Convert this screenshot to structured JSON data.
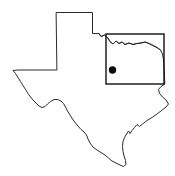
{
  "figure": {
    "name": "texas-state-map",
    "background_color": "#ffffff",
    "width": 175,
    "height": 176
  },
  "map": {
    "region_name": "Texas",
    "outline_color": "#2b2b2b",
    "outline_width": 1,
    "fill_color": "#ffffff",
    "outline_path": "M 56.5 12.5 L 92.5 12.5 L 92.5 33.5 L 99.0 33.5 L 101.0 36.5 L 104.5 35.0 L 107.5 37.5 L 110.0 41.5 L 113.0 44.0 L 116.0 41.0 L 119.0 43.5 L 122.0 42.0 L 125.0 44.5 L 129.0 43.0 L 133.0 44.5 L 137.0 43.5 L 141.0 43.0 L 145.0 42.0 L 149.0 43.5 L 153.0 45.5 L 157.0 47.5 L 160.5 50.0 L 162.5 54.0 L 163.5 60.0 L 164.0 68.0 L 164.5 76.0 L 164.8 84.0 L 161.0 86.5 L 158.5 89.5 L 159.5 93.5 L 162.5 97.0 L 166.0 100.0 L 168.5 104.0 L 166.0 107.0 L 161.5 110.5 L 157.0 114.0 L 152.0 117.5 L 147.0 120.5 L 142.5 124.0 L 139.5 126.5 L 137.0 124.5 L 134.5 127.5 L 132.0 130.5 L 130.0 133.5 L 128.5 131.0 L 126.5 134.0 L 124.5 137.5 L 123.0 141.5 L 122.5 146.5 L 123.0 151.5 L 124.0 156.0 L 125.5 160.5 L 126.0 164.5 L 123.5 166.5 L 120.0 165.0 L 116.0 163.0 L 112.0 161.0 L 108.5 158.0 L 105.0 155.0 L 101.0 152.5 L 97.0 150.0 L 93.0 147.0 L 90.0 143.0 L 88.0 139.0 L 86.5 135.0 L 84.0 132.0 L 81.0 129.5 L 78.0 126.0 L 75.0 122.5 L 72.5 119.0 L 70.0 115.0 L 67.5 111.0 L 65.5 107.0 L 63.5 103.5 L 61.0 101.0 L 57.5 99.5 L 54.0 99.5 L 50.5 101.5 L 47.5 104.0 L 45.0 106.5 L 42.0 107.5 L 39.0 106.0 L 36.0 103.0 L 33.0 100.0 L 30.5 97.0 L 28.0 93.5 L 25.5 89.5 L 23.0 85.5 L 20.5 81.5 L 18.0 77.5 L 15.5 73.5 L 13.0 70.5 L 18.0 70.0 L 26.0 70.0 L 36.0 70.0 L 46.0 70.0 L 56.5 70.0 Z",
    "river_border_path": "M 99.0 33.5 L 101.0 36.5 L 104.5 35.0 L 107.5 37.5 L 110.0 41.5 L 113.0 44.0 L 116.0 41.0 L 119.0 43.5 L 122.0 42.0 L 125.0 44.5 L 129.0 43.0 L 133.0 44.5 L 137.0 43.5 L 141.0 43.0 L 145.0 42.0 L 149.0 43.5 L 153.0 45.5 L 157.0 47.5 L 160.5 50.0"
  },
  "inset_box": {
    "name": "study-area-box",
    "stroke_color": "#111111",
    "stroke_width": 1.4,
    "x": 106,
    "y": 34,
    "width": 58,
    "height": 50
  },
  "marker": {
    "name": "location-dot",
    "color": "#0b0b0b",
    "cx": 112.5,
    "cy": 70,
    "radius": 3.7
  }
}
